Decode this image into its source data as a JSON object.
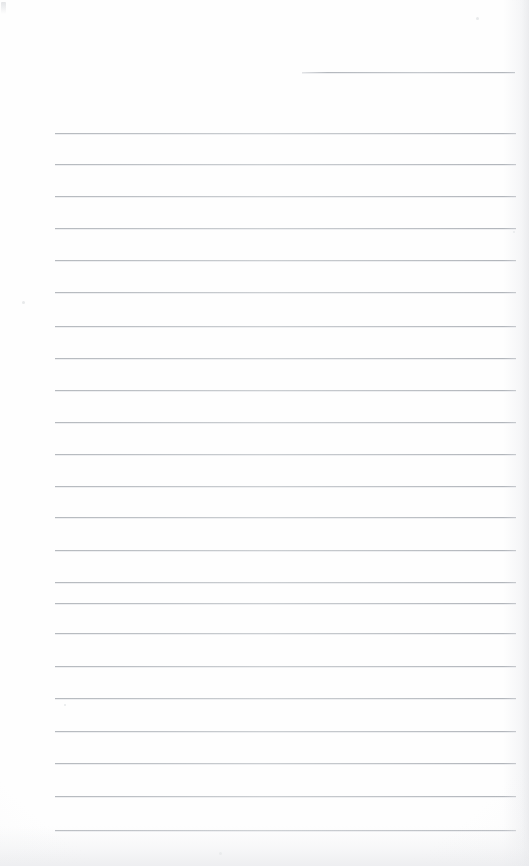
{
  "document": {
    "kind": "scanned-lined-paper",
    "title": "Blank ruled notebook page",
    "page_width": 529,
    "page_height": 866,
    "visible_text": "",
    "handwriting_present": "no",
    "printed_text_present": "no"
  },
  "paper": {
    "background_color": "#fefefe",
    "rule_color": "#b6babf",
    "rule_thickness_px": 1,
    "rule_left_x": 55,
    "rule_right_x": 516,
    "rule_spacing_px": 31.7,
    "edge_shadow_color": "#e8e9ec"
  },
  "rules": {
    "partial_top": {
      "label": "partial-rule-top-right",
      "y": 72,
      "x_start": 302,
      "x_end": 515
    },
    "full_lines": [
      {
        "index": 1,
        "y": 133
      },
      {
        "index": 2,
        "y": 164
      },
      {
        "index": 3,
        "y": 196
      },
      {
        "index": 4,
        "y": 228
      },
      {
        "index": 5,
        "y": 260
      },
      {
        "index": 6,
        "y": 292
      },
      {
        "index": 7,
        "y": 326
      },
      {
        "index": 8,
        "y": 358
      },
      {
        "index": 9,
        "y": 390
      },
      {
        "index": 10,
        "y": 422
      },
      {
        "index": 11,
        "y": 454
      },
      {
        "index": 12,
        "y": 486
      },
      {
        "index": 13,
        "y": 517
      },
      {
        "index": 14,
        "y": 550
      },
      {
        "index": 15,
        "y": 582
      },
      {
        "index": 16,
        "y": 603
      },
      {
        "index": 17,
        "y": 633
      },
      {
        "index": 18,
        "y": 666
      },
      {
        "index": 19,
        "y": 698
      },
      {
        "index": 20,
        "y": 731
      },
      {
        "index": 21,
        "y": 763
      },
      {
        "index": 22,
        "y": 796
      },
      {
        "index": 23,
        "y": 830
      }
    ],
    "count_full": 23,
    "count_partial": 1
  },
  "artifacts": {
    "specks": [
      {
        "x": 22,
        "y": 301,
        "size": 3
      },
      {
        "x": 476,
        "y": 17,
        "size": 3
      },
      {
        "x": 513,
        "y": 231,
        "size": 2
      },
      {
        "x": 64,
        "y": 704,
        "size": 2
      },
      {
        "x": 219,
        "y": 852,
        "size": 3
      }
    ]
  }
}
